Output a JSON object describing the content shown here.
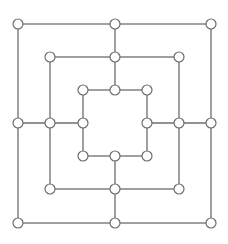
{
  "game": "Nine Men's Morris",
  "colors": {
    "line": "#6e6e6e",
    "node_fill": "#ffffff",
    "background": "#ffffff"
  },
  "node_radius": 5,
  "squares": [
    {
      "name": "outer",
      "x1": 18,
      "y1": 24,
      "x2": 211,
      "y2": 223
    },
    {
      "name": "middle",
      "x1": 50,
      "y1": 57,
      "x2": 179,
      "y2": 189
    },
    {
      "name": "inner",
      "x1": 83,
      "y1": 90,
      "x2": 147,
      "y2": 156
    }
  ],
  "connectors": [
    {
      "name": "top",
      "x1": 115,
      "y1": 24,
      "x2": 115,
      "y2": 90
    },
    {
      "name": "bottom",
      "x1": 115,
      "y1": 156,
      "x2": 115,
      "y2": 223
    },
    {
      "name": "left",
      "x1": 18,
      "y1": 123,
      "x2": 83,
      "y2": 123
    },
    {
      "name": "right",
      "x1": 147,
      "y1": 123,
      "x2": 211,
      "y2": 123
    }
  ],
  "points": [
    {
      "id": "a1",
      "x": 18,
      "y": 24
    },
    {
      "id": "a2",
      "x": 115,
      "y": 24
    },
    {
      "id": "a3",
      "x": 211,
      "y": 24
    },
    {
      "id": "b1",
      "x": 50,
      "y": 57
    },
    {
      "id": "b2",
      "x": 115,
      "y": 57
    },
    {
      "id": "b3",
      "x": 179,
      "y": 57
    },
    {
      "id": "c1",
      "x": 83,
      "y": 90
    },
    {
      "id": "c2",
      "x": 115,
      "y": 90
    },
    {
      "id": "c3",
      "x": 147,
      "y": 90
    },
    {
      "id": "d1",
      "x": 18,
      "y": 123
    },
    {
      "id": "d2",
      "x": 50,
      "y": 123
    },
    {
      "id": "d3",
      "x": 83,
      "y": 123
    },
    {
      "id": "d4",
      "x": 147,
      "y": 123
    },
    {
      "id": "d5",
      "x": 179,
      "y": 123
    },
    {
      "id": "d6",
      "x": 211,
      "y": 123
    },
    {
      "id": "e1",
      "x": 83,
      "y": 156
    },
    {
      "id": "e2",
      "x": 115,
      "y": 156
    },
    {
      "id": "e3",
      "x": 147,
      "y": 156
    },
    {
      "id": "f1",
      "x": 50,
      "y": 189
    },
    {
      "id": "f2",
      "x": 115,
      "y": 189
    },
    {
      "id": "f3",
      "x": 179,
      "y": 189
    },
    {
      "id": "g1",
      "x": 18,
      "y": 223
    },
    {
      "id": "g2",
      "x": 115,
      "y": 223
    },
    {
      "id": "g3",
      "x": 211,
      "y": 223
    }
  ]
}
